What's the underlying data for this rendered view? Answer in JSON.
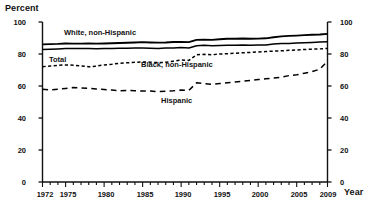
{
  "titles": {
    "y_axis_title": "Percent",
    "x_axis_title": "Year"
  },
  "axes": {
    "y_ticks": [
      "0",
      "20",
      "40",
      "60",
      "80",
      "100"
    ],
    "y_ticks_right": [
      "0",
      "20",
      "40",
      "60",
      "80",
      "100"
    ],
    "x_ticks_labeled": [
      "1972",
      "1975",
      "1980",
      "1985",
      "1990",
      "1995",
      "2000",
      "2005",
      "2009"
    ]
  },
  "series_labels": {
    "white": "White, non-Hispanic",
    "total": "Total",
    "black": "Black, non-Hispanic",
    "hispanic": "Hispanic"
  },
  "chart_data": {
    "type": "line",
    "title": "",
    "xlabel": "Year",
    "ylabel": "Percent",
    "xlim": [
      1972,
      2009
    ],
    "ylim": [
      0,
      100
    ],
    "ytick_step": 20,
    "grid": false,
    "legend": "inline-annotations",
    "x": [
      1972,
      1973,
      1974,
      1975,
      1976,
      1977,
      1978,
      1979,
      1980,
      1981,
      1982,
      1983,
      1984,
      1985,
      1986,
      1987,
      1988,
      1989,
      1990,
      1991,
      1992,
      1993,
      1994,
      1995,
      1996,
      1997,
      1998,
      1999,
      2000,
      2001,
      2002,
      2003,
      2004,
      2005,
      2006,
      2007,
      2008,
      2009
    ],
    "series": [
      {
        "name": "White, non-Hispanic",
        "style": "solid-thick",
        "color": "#000000",
        "values": [
          86.0,
          86.2,
          86.3,
          86.6,
          86.5,
          86.5,
          86.6,
          86.5,
          86.6,
          86.7,
          86.9,
          87.0,
          87.2,
          87.4,
          87.2,
          87.1,
          87.2,
          87.5,
          87.6,
          87.4,
          88.8,
          89.0,
          88.8,
          89.2,
          89.5,
          89.5,
          89.7,
          89.5,
          89.6,
          89.8,
          90.5,
          91.0,
          91.3,
          91.5,
          91.8,
          92.0,
          92.2,
          92.6
        ]
      },
      {
        "name": "Total",
        "style": "solid-thin",
        "color": "#000000",
        "values": [
          82.8,
          83.0,
          83.2,
          83.5,
          83.5,
          83.4,
          83.4,
          83.3,
          83.4,
          83.5,
          83.6,
          83.6,
          83.7,
          83.8,
          83.6,
          83.5,
          83.7,
          83.8,
          84.0,
          83.8,
          85.2,
          85.4,
          85.1,
          85.3,
          85.4,
          85.4,
          85.6,
          85.5,
          85.6,
          85.7,
          86.2,
          86.5,
          86.6,
          86.8,
          87.0,
          87.2,
          87.5,
          87.7
        ]
      },
      {
        "name": "Black, non-Hispanic",
        "style": "dashed-short",
        "color": "#000000",
        "values": [
          72.1,
          72.5,
          72.9,
          73.2,
          73.0,
          72.6,
          72.0,
          72.4,
          73.2,
          73.6,
          74.2,
          74.5,
          74.8,
          75.0,
          74.9,
          74.6,
          74.8,
          75.5,
          76.2,
          76.0,
          79.5,
          79.8,
          79.5,
          80.0,
          80.2,
          80.5,
          80.8,
          81.0,
          81.3,
          81.5,
          81.8,
          82.0,
          82.3,
          82.5,
          82.8,
          83.0,
          83.2,
          83.5
        ]
      },
      {
        "name": "Hispanic",
        "style": "dashed-long",
        "color": "#000000",
        "values": [
          58.0,
          57.5,
          58.0,
          58.5,
          59.0,
          58.8,
          58.5,
          58.2,
          57.8,
          57.5,
          57.0,
          57.2,
          57.0,
          56.8,
          56.9,
          56.5,
          56.8,
          57.0,
          57.5,
          57.2,
          62.0,
          61.5,
          61.0,
          61.5,
          62.0,
          62.5,
          63.0,
          63.5,
          64.0,
          64.5,
          65.0,
          65.5,
          66.5,
          67.0,
          68.0,
          69.0,
          70.5,
          75.5
        ]
      }
    ]
  }
}
